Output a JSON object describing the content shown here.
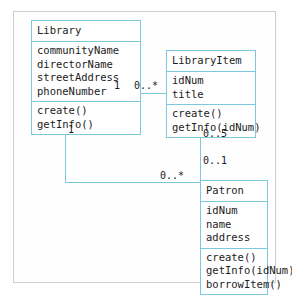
{
  "diagram": {
    "accent_color": "#7ec8dd",
    "text_color": "#1b1b1b",
    "frame_color": "#cfcfcf",
    "background": "#ffffff",
    "classes": [
      {
        "id": "library",
        "name": "Library",
        "attributes": [
          "communityName",
          "directorName",
          "streetAddress",
          "phoneNumber"
        ],
        "operations": [
          "create()",
          "getInfo()"
        ]
      },
      {
        "id": "libraryitem",
        "name": "LibraryItem",
        "attributes": [
          "idNum",
          "title"
        ],
        "operations": [
          "create()",
          "getInfo(idNum)"
        ]
      },
      {
        "id": "patron",
        "name": "Patron",
        "attributes": [
          "idNum",
          "name",
          "address"
        ],
        "operations": [
          "create()",
          "getInfo(idNum)",
          "borrowItem()"
        ]
      }
    ],
    "associations": [
      {
        "id": "library-libraryitem",
        "from": "Library",
        "to": "LibraryItem",
        "from_multiplicity": "1",
        "to_multiplicity": "0..*"
      },
      {
        "id": "libraryitem-patron",
        "from": "LibraryItem",
        "to": "Patron",
        "from_multiplicity": "0..5",
        "to_multiplicity": "0..1"
      },
      {
        "id": "library-patron",
        "from": "Library",
        "to": "Patron",
        "from_multiplicity": "1",
        "to_multiplicity": "0..*"
      }
    ]
  }
}
